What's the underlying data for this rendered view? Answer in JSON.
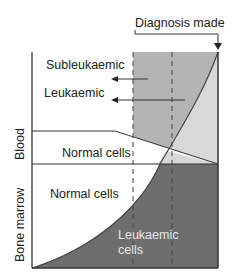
{
  "diagram": {
    "top_label": "Diagnosis made",
    "arrow_labels": [
      "Subleukaemic",
      "Leukaemic"
    ],
    "axis_labels": {
      "blood": "Blood",
      "bone_marrow": "Bone marrow"
    },
    "region_labels": {
      "blood_normal": "Normal cells",
      "marrow_normal": "Normal cells",
      "marrow_leukaemic_line1": "Leukaemic",
      "marrow_leukaemic_line2": "cells"
    },
    "caption": "Fig. 20.1 D...",
    "colors": {
      "dark_region": "#6e6e6e",
      "mid_region": "#b4b4b4",
      "light_region": "#d8d8d8",
      "line": "#333333"
    }
  }
}
